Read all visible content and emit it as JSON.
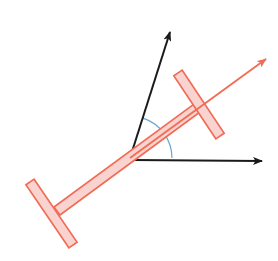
{
  "diagram": {
    "colors": {
      "background": "#ffffff",
      "beam_fill": "#f9d3cf",
      "beam_stroke": "#f26b55",
      "orange_vector": "#f26b55",
      "black_vector": "#1a1a1a",
      "angle_arc": "#6aa6cf"
    },
    "origin": {
      "x": 130,
      "y": 158
    },
    "vectors": [
      {
        "name": "vertical-ish-vector",
        "color": "#1a1a1a",
        "from": [
          130,
          158
        ],
        "to": [
          170,
          32
        ]
      },
      {
        "name": "horizontal-vector",
        "color": "#1a1a1a",
        "from": [
          132,
          160
        ],
        "to": [
          262,
          161
        ]
      },
      {
        "name": "beam-axis-vector",
        "color": "#f26b55",
        "from": [
          130,
          158
        ],
        "to": [
          266,
          59
        ]
      }
    ],
    "beam": {
      "shaft": {
        "from": [
          57,
          211
        ],
        "to": [
          197,
          108
        ],
        "width": 10
      },
      "end_top": {
        "from": [
          178,
          73
        ],
        "to": [
          220,
          136
        ],
        "width": 10
      },
      "end_bottom": {
        "from": [
          30,
          182
        ],
        "to": [
          73,
          245
        ],
        "width": 10
      }
    },
    "angle_arc": {
      "center": [
        130,
        158
      ],
      "radius": 42,
      "from_deg": 0,
      "to_deg": 72
    }
  }
}
